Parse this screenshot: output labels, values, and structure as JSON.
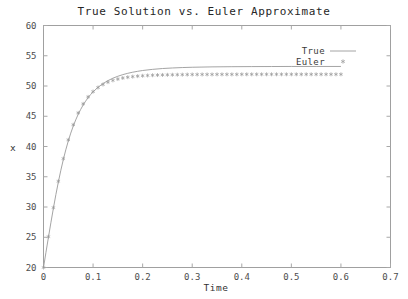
{
  "chart_data": {
    "type": "line",
    "title": "True Solution vs. Euler Approximate",
    "xlabel": "Time",
    "ylabel": "x",
    "xlim": [
      0,
      0.7
    ],
    "ylim": [
      20,
      60
    ],
    "grid": false,
    "legend_position": "top-right-inside",
    "xticks": [
      0,
      0.1,
      0.2,
      0.3,
      0.4,
      0.5,
      0.6,
      0.7
    ],
    "xtick_labels": [
      "0",
      "0.1",
      "0.2",
      "0.3",
      "0.4",
      "0.5",
      "0.6",
      "0.7"
    ],
    "yticks": [
      20,
      25,
      30,
      35,
      40,
      45,
      50,
      55,
      60
    ],
    "ytick_labels": [
      "20",
      "25",
      "30",
      "35",
      "40",
      "45",
      "50",
      "55",
      "60"
    ],
    "series": [
      {
        "name": "True",
        "style": "line",
        "color": "#9a9a9a",
        "x": [
          0,
          0.005,
          0.01,
          0.015,
          0.02,
          0.025,
          0.03,
          0.035,
          0.04,
          0.045,
          0.05,
          0.055,
          0.06,
          0.065,
          0.07,
          0.075,
          0.08,
          0.085,
          0.09,
          0.095,
          0.1,
          0.11,
          0.12,
          0.13,
          0.14,
          0.15,
          0.16,
          0.17,
          0.18,
          0.19,
          0.2,
          0.22,
          0.24,
          0.26,
          0.28,
          0.3,
          0.34,
          0.38,
          0.42,
          0.46,
          0.5,
          0.55,
          0.6
        ],
        "y": [
          20.0,
          22.52,
          25.02,
          27.46,
          29.81,
          32.05,
          34.14,
          36.08,
          37.85,
          39.46,
          40.91,
          42.21,
          43.37,
          44.4,
          45.32,
          46.13,
          46.86,
          47.5,
          48.07,
          48.58,
          49.03,
          49.79,
          50.4,
          50.89,
          51.29,
          51.61,
          51.88,
          52.1,
          52.28,
          52.43,
          52.56,
          52.75,
          52.89,
          52.98,
          53.05,
          53.1,
          53.16,
          53.19,
          53.21,
          53.22,
          53.23,
          53.23,
          53.23
        ]
      },
      {
        "name": "Euler",
        "style": "points",
        "marker": "asterisk",
        "color": "#9a9a9a",
        "x": [
          0,
          0.01,
          0.02,
          0.03,
          0.04,
          0.05,
          0.06,
          0.07,
          0.08,
          0.09,
          0.1,
          0.11,
          0.12,
          0.13,
          0.14,
          0.15,
          0.16,
          0.17,
          0.18,
          0.19,
          0.2,
          0.21,
          0.22,
          0.23,
          0.24,
          0.25,
          0.26,
          0.27,
          0.28,
          0.29,
          0.3,
          0.31,
          0.32,
          0.33,
          0.34,
          0.35,
          0.36,
          0.37,
          0.38,
          0.39,
          0.4,
          0.41,
          0.42,
          0.43,
          0.44,
          0.45,
          0.46,
          0.47,
          0.48,
          0.49,
          0.5,
          0.51,
          0.52,
          0.53,
          0.54,
          0.55,
          0.56,
          0.57,
          0.58,
          0.59,
          0.6
        ],
        "y": [
          20.0,
          25.1,
          29.9,
          34.25,
          38.0,
          41.1,
          43.6,
          45.55,
          47.05,
          48.2,
          49.08,
          49.75,
          50.25,
          50.64,
          50.93,
          51.15,
          51.32,
          51.45,
          51.55,
          51.63,
          51.69,
          51.74,
          51.78,
          51.81,
          51.83,
          51.85,
          51.86,
          51.87,
          51.88,
          51.89,
          51.9,
          51.9,
          51.91,
          51.91,
          51.91,
          51.92,
          51.92,
          51.92,
          51.92,
          51.92,
          51.93,
          51.93,
          51.93,
          51.93,
          51.93,
          51.93,
          51.93,
          51.93,
          51.93,
          51.93,
          51.93,
          51.93,
          51.93,
          51.93,
          51.93,
          51.93,
          51.93,
          51.93,
          51.93,
          51.93,
          51.93
        ]
      }
    ],
    "legend_entries": [
      {
        "label": "True",
        "sample": "line"
      },
      {
        "label": "Euler",
        "sample": "asterisk"
      }
    ]
  },
  "style": {
    "frame_color": "#a0a0a0",
    "tick_color": "#a8a8a8",
    "text_color": "#333333",
    "background": "#ffffff"
  }
}
